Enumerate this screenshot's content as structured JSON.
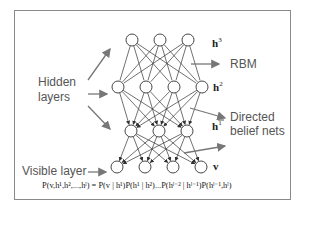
{
  "diagram": {
    "labels": {
      "hidden_layers": "Hidden\nlayers",
      "hidden_layers_line1": "Hidden",
      "hidden_layers_line2": "layers",
      "rbm": "RBM",
      "directed_line1": "Directed",
      "directed_line2": "belief nets",
      "visible_layer": "Visible layer"
    },
    "layer_labels": {
      "h3": "h",
      "h3_sup": "3",
      "h2": "h",
      "h2_sup": "2",
      "h1": "h",
      "h1_sup": "1",
      "v": "v"
    },
    "layers": [
      {
        "name": "h3",
        "nodes": 3,
        "y": 40,
        "xs": [
          132,
          160,
          188
        ]
      },
      {
        "name": "h2",
        "nodes": 4,
        "y": 87,
        "xs": [
          118,
          146,
          174,
          202
        ]
      },
      {
        "name": "h1",
        "nodes": 3,
        "y": 131,
        "xs": [
          131,
          159,
          187
        ]
      },
      {
        "name": "v",
        "nodes": 4,
        "y": 167,
        "xs": [
          117,
          145,
          173,
          201
        ]
      }
    ],
    "connections": [
      {
        "from": "h3",
        "to": "h2",
        "type": "undirected",
        "group": "RBM"
      },
      {
        "from": "h2",
        "to": "h1",
        "type": "directed",
        "group": "Directed belief nets"
      },
      {
        "from": "h1",
        "to": "v",
        "type": "directed",
        "group": "Directed belief nets"
      }
    ],
    "formula": "P(v,h¹,h²,...,hˡ) = P(v | h¹)P(h¹ | h²)...P(hˡ⁻² | hˡ⁻¹)P(hˡ⁻¹,hˡ)",
    "colors": {
      "line": "#333333",
      "arrow": "#666666",
      "label": "#555555",
      "frame": "#8a8a8a"
    }
  }
}
